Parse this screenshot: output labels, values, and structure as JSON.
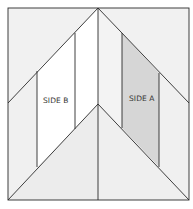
{
  "diagram": {
    "type": "quilt-block-chevron",
    "labels": {
      "side_a": "SIDE A",
      "side_b": "SIDE B"
    },
    "colors": {
      "background": "#ffffff",
      "outer_fill": "#f2f2f2",
      "lower_chevron_fill": "#ededed",
      "side_a_fill": "#d6d6d6",
      "side_b_fill": "#ffffff",
      "center_left_strip": "#ffffff",
      "center_right_strip": "#f3f3f3",
      "stroke": "#2a2a2a"
    }
  }
}
